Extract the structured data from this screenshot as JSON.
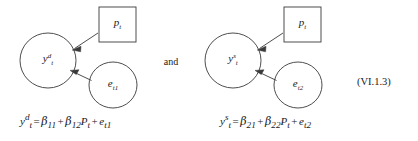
{
  "figure": {
    "equation_number": "(VI.1.3)",
    "conjunction": "and",
    "panels": [
      {
        "id": "demand",
        "nodes": {
          "outcome": {
            "shape": "circle",
            "var": "y",
            "sup": "d",
            "sub": "t"
          },
          "predictor": {
            "shape": "square",
            "var": "p",
            "sup": "",
            "sub": "t"
          },
          "error": {
            "shape": "circle",
            "var": "e",
            "sup": "",
            "sub": "t1"
          }
        },
        "edges": [
          {
            "from": "predictor",
            "to": "outcome",
            "arrow": "single"
          },
          {
            "from": "error",
            "to": "outcome",
            "arrow": "single"
          }
        ],
        "equation": {
          "lhs_var": "y",
          "lhs_sup": "d",
          "lhs_sub": "t",
          "equals": "=",
          "terms": [
            {
              "symbol": "β",
              "sub": "11",
              "factor": ""
            },
            {
              "symbol": "β",
              "sub": "12",
              "factor": "P",
              "factor_sub": "t"
            },
            {
              "symbol": "e",
              "sub": "t1",
              "factor": ""
            }
          ],
          "plus": "+"
        }
      },
      {
        "id": "supply",
        "nodes": {
          "outcome": {
            "shape": "circle",
            "var": "y",
            "sup": "s",
            "sub": "t"
          },
          "predictor": {
            "shape": "square",
            "var": "p",
            "sup": "",
            "sub": "t"
          },
          "error": {
            "shape": "circle",
            "var": "e",
            "sup": "",
            "sub": "t2"
          }
        },
        "edges": [
          {
            "from": "predictor",
            "to": "outcome",
            "arrow": "single"
          },
          {
            "from": "error",
            "to": "outcome",
            "arrow": "single"
          }
        ],
        "equation": {
          "lhs_var": "y",
          "lhs_sup": "s",
          "lhs_sub": "t",
          "equals": "=",
          "terms": [
            {
              "symbol": "β",
              "sub": "21",
              "factor": ""
            },
            {
              "symbol": "β",
              "sub": "22",
              "factor": "P",
              "factor_sub": "t"
            },
            {
              "symbol": "e",
              "sub": "t2",
              "factor": ""
            }
          ],
          "plus": "+"
        }
      }
    ]
  },
  "colors": {
    "stroke": "#3a3a3a",
    "text": "#1a1a1a",
    "background": "#ffffff"
  }
}
